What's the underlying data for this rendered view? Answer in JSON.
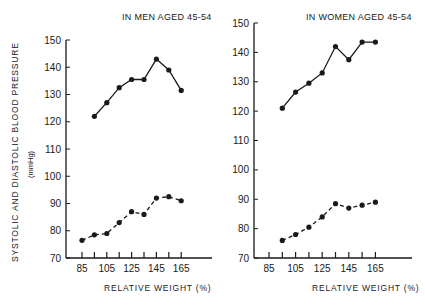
{
  "ylabel": "SYSTOLIC AND DIASTOLIC BLOOD PRESSURE",
  "yunit": "(mmHg)",
  "chart_data": [
    {
      "type": "line",
      "title": "IN MEN AGED 45-54",
      "xlabel": "RELATIVE WEIGHT (%)",
      "ylabel": "SYSTOLIC AND DIASTOLIC BLOOD PRESSURE (mmHg)",
      "ylim": [
        70,
        150
      ],
      "yticks": [
        70,
        80,
        90,
        100,
        110,
        120,
        130,
        140,
        150
      ],
      "xtick_labels": [
        85,
        105,
        125,
        145,
        165
      ],
      "x": [
        85,
        95,
        105,
        115,
        125,
        135,
        145,
        155,
        165
      ],
      "series": [
        {
          "name": "Systolic",
          "style": "solid",
          "x": [
            90,
            100,
            110,
            120,
            130,
            140,
            150,
            160
          ],
          "values": [
            122,
            127,
            132.5,
            135.5,
            135.5,
            143,
            139,
            131.5
          ]
        },
        {
          "name": "Diastolic",
          "style": "dashed",
          "x": [
            80,
            90,
            100,
            110,
            120,
            130,
            140,
            150,
            160
          ],
          "values": [
            76.5,
            78.5,
            79,
            83,
            87,
            86,
            92,
            92.5,
            91
          ]
        }
      ]
    },
    {
      "type": "line",
      "title": "IN WOMEN AGED 45-54",
      "xlabel": "RELATIVE WEIGHT (%)",
      "ylabel": "",
      "ylim": [
        70,
        150
      ],
      "yticks": [
        70,
        80,
        90,
        100,
        110,
        120,
        130,
        140,
        150
      ],
      "xtick_labels": [
        85,
        105,
        125,
        145,
        165
      ],
      "x": [
        85,
        95,
        105,
        115,
        125,
        135,
        145,
        155,
        165
      ],
      "series": [
        {
          "name": "Systolic",
          "style": "solid",
          "x": [
            95,
            105,
            115,
            125,
            135,
            145,
            155,
            165
          ],
          "values": [
            121,
            126.5,
            129.5,
            133,
            142,
            137.5,
            143.5,
            143.5
          ]
        },
        {
          "name": "Diastolic",
          "style": "dashed",
          "x": [
            95,
            105,
            115,
            125,
            135,
            145,
            155,
            165
          ],
          "values": [
            76,
            78,
            80.5,
            84,
            88.5,
            87,
            88,
            89
          ]
        }
      ]
    }
  ]
}
